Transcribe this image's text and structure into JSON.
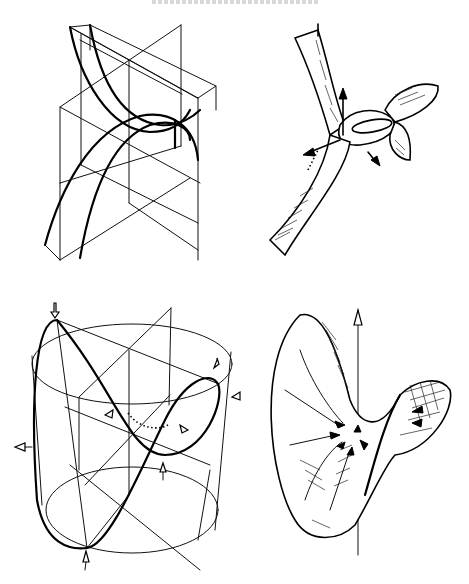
{
  "page": {
    "running_header": "",
    "header_cropped": true,
    "background": "#ffffff",
    "ink": "#000000"
  },
  "figures": [
    {
      "id": "top-left",
      "description": "Wireframe of intersecting planes with two crossing thick curves (parabolic sections)",
      "style": "wireframe"
    },
    {
      "id": "top-right",
      "description": "Shaded ribbon surface twisting into a loop with three normal arrows",
      "style": "hatched-surface",
      "arrows": 3
    },
    {
      "id": "bottom-left",
      "description": "Cylinder wireframe with a thick saddle curve on its surface and direction arrows",
      "style": "wireframe",
      "arrows": 8
    },
    {
      "id": "bottom-right",
      "description": "Hatched saddle-shaped surface with vertical axis arrow and arrows converging to center",
      "style": "hatched-surface",
      "arrows": 10
    }
  ]
}
